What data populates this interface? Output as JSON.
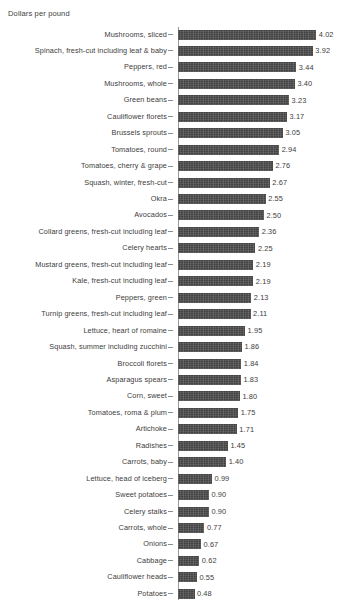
{
  "chart_data": {
    "type": "bar",
    "orientation": "horizontal",
    "title": "",
    "xlabel": "Dollars per pound",
    "ylabel": "",
    "axis_title": "Dollars per pound",
    "grid": false,
    "legend": false,
    "xlim": [
      0,
      4.02
    ],
    "value_format": "2dp",
    "bar_color": "#4d4d4d",
    "axis_color": "#9a9a9a",
    "text_color": "#3d3d3d",
    "categories": [
      "Mushrooms, sliced",
      "Spinach, fresh-cut including leaf & baby",
      "Peppers, red",
      "Mushrooms, whole",
      "Green beans",
      "Cauliflower florets",
      "Brussels sprouts",
      "Tomatoes, round",
      "Tomatoes, cherry & grape",
      "Squash, winter, fresh-cut",
      "Okra",
      "Avocados",
      "Collard greens, fresh-cut including leaf",
      "Celery hearts",
      "Mustard greens, fresh-cut including leaf",
      "Kale, fresh-cut including leaf",
      "Peppers, green",
      "Turnip greens, fresh-cut including leaf",
      "Lettuce, heart of romaine",
      "Squash, summer including zucchini",
      "Broccoli florets",
      "Asparagus spears",
      "Corn, sweet",
      "Tomatoes, roma & plum",
      "Artichoke",
      "Radishes",
      "Carrots, baby",
      "Lettuce, head of iceberg",
      "Sweet potatoes",
      "Celery stalks",
      "Carrots, whole",
      "Onions",
      "Cabbage",
      "Cauliflower heads",
      "Potatoes"
    ],
    "values": [
      4.02,
      3.92,
      3.44,
      3.4,
      3.23,
      3.17,
      3.05,
      2.94,
      2.76,
      2.67,
      2.55,
      2.5,
      2.36,
      2.25,
      2.19,
      2.19,
      2.13,
      2.11,
      1.95,
      1.86,
      1.84,
      1.83,
      1.8,
      1.75,
      1.71,
      1.45,
      1.4,
      0.99,
      0.9,
      0.9,
      0.77,
      0.67,
      0.62,
      0.55,
      0.48
    ],
    "value_labels": [
      "4.02",
      "3.92",
      "3.44",
      "3.40",
      "3.23",
      "3.17",
      "3.05",
      "2.94",
      "2.76",
      "2.67",
      "2.55",
      "2.50",
      "2.36",
      "2.25",
      "2.19",
      "2.19",
      "2.13",
      "2.11",
      "1.95",
      "1.86",
      "1.84",
      "1.83",
      "1.80",
      "1.75",
      "1.71",
      "1.45",
      "1.40",
      "0.99",
      "0.90",
      "0.90",
      "0.77",
      "0.67",
      "0.62",
      "0.55",
      "0.48"
    ]
  },
  "layout": {
    "axis_x": 178,
    "first_bar_top": 29.5,
    "row_pitch": 16.45,
    "bar_height": 10,
    "px_per_unit": 34.4
  }
}
